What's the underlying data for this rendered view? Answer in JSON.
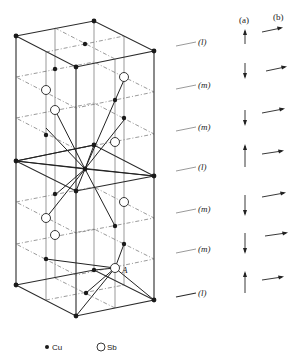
{
  "diagram": {
    "type": "crystal-structure",
    "layers": [
      {
        "label": "(l)",
        "y": 46
      },
      {
        "label": "(m)",
        "y": 90
      },
      {
        "label": "(m)",
        "y": 128
      },
      {
        "label": "(l)",
        "y": 166
      },
      {
        "label": "(m)",
        "y": 210
      },
      {
        "label": "(m)",
        "y": 248
      },
      {
        "label": "(l)",
        "y": 292
      }
    ],
    "columns": {
      "a": "(a)",
      "b": "(b)"
    },
    "spins_a": [
      "up",
      "down",
      "down",
      "up",
      "down",
      "down",
      "up"
    ],
    "point_label": "A",
    "legend": [
      {
        "symbol": "filled-circle",
        "label": "Cu"
      },
      {
        "symbol": "open-circle",
        "label": "Sb"
      }
    ]
  }
}
